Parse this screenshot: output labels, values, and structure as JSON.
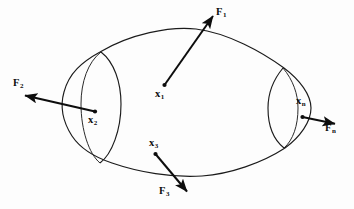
{
  "figure": {
    "kind": "free-body-diagram",
    "background_color": "#fdfdfd",
    "stroke_color": "#0d0d0d",
    "outline_color": "#1b1b1b"
  },
  "labels": {
    "force_1": {
      "symbol": "F",
      "subscript": "1",
      "x": 216,
      "y": 7
    },
    "force_2": {
      "symbol": "F",
      "subscript": "2",
      "x": 13,
      "y": 78
    },
    "force_3": {
      "symbol": "F",
      "subscript": "3",
      "x": 159,
      "y": 186
    },
    "force_n": {
      "symbol": "F",
      "subscript": "n",
      "x": 325,
      "y": 123
    },
    "point_1": {
      "symbol": "x",
      "subscript": "1",
      "x": 155,
      "y": 89
    },
    "point_2": {
      "symbol": "x",
      "subscript": "2",
      "x": 88,
      "y": 115
    },
    "point_3": {
      "symbol": "x",
      "subscript": "3",
      "x": 149,
      "y": 138
    },
    "point_n": {
      "symbol": "x",
      "subscript": "n",
      "x": 296,
      "y": 96
    }
  },
  "points": [
    {
      "name": "x1",
      "cx": 164.5,
      "cy": 85.0,
      "r": 2.1
    },
    {
      "name": "x2",
      "cx": 95.0,
      "cy": 111.5,
      "r": 2.1
    },
    {
      "name": "x3",
      "cx": 155.5,
      "cy": 154.0,
      "r": 2.1
    },
    {
      "name": "xn",
      "cx": 302.5,
      "cy": 117.0,
      "r": 2.1
    }
  ],
  "arrows": [
    {
      "name": "F1",
      "x1": 164.5,
      "y1": 85.0,
      "x2": 215.0,
      "y2": 14.0
    },
    {
      "name": "F2",
      "x1": 95.0,
      "y1": 111.5,
      "x2": 22.5,
      "y2": 95.0
    },
    {
      "name": "F3",
      "x1": 155.5,
      "y1": 154.0,
      "x2": 189.0,
      "y2": 194.0
    },
    {
      "name": "Fn",
      "x1": 302.5,
      "y1": 117.0,
      "x2": 338.0,
      "y2": 124.5
    }
  ],
  "outline": {
    "description": "closed blob outline of the deformable body",
    "path": "M 100 52 C 130 34, 170 26, 196 29 C 228 33, 262 52, 284 68 C 300 80, 311 95, 311 108 C 311 122, 300 137, 285 148 C 262 163, 230 174, 202 176 C 172 178, 138 172, 112 163 C 94 157, 80 148, 72 136 C 63 122, 60 106, 64 92 C 69 73, 82 62, 100 52 Z"
  },
  "cross_sections": [
    {
      "name": "left-cut",
      "visible_arc": "M 101 52 C 114 62, 121 82, 121 104 C 121 130, 112 154, 100 163",
      "hidden_arc": "M 101 52 C 88 62, 81 82, 81 104 C 81 130, 89 154, 100 163"
    },
    {
      "name": "right-cut",
      "visible_arc": "M 283 68 C 273 80, 268 94, 268 108 C 268 126, 274 140, 284 148",
      "hidden_arc": "M 283 68 C 293 80, 298 94, 298 108 C 298 126, 293 140, 284 148"
    }
  ]
}
